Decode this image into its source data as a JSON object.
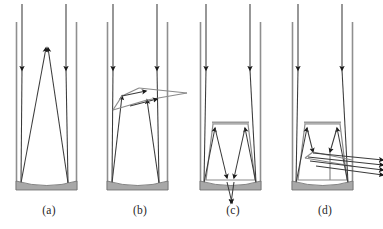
{
  "figure": {
    "width": 383,
    "height": 229,
    "background_color": "#ffffff",
    "colors": {
      "ray_stroke": "#3a3a3a",
      "arrowhead_fill": "#1a1a1a",
      "tube_wall": "#8f8f8f",
      "mirror_fill": "#a8a8a8",
      "mirror_stroke": "#6d6d6d",
      "insert_stroke": "#8a8a8a",
      "label_color": "#1f1f1f"
    },
    "panels": [
      {
        "id": "a",
        "label": "(a)",
        "label_x": 49,
        "label_y": 214,
        "description": "Two vertical rays enter the tube, strike the concave bottom mirror and reflect upward converging to an apex near the top of the tube.",
        "incoming_ray_count": 2,
        "reflected_ray_count": 2,
        "escaping_ray_count": 0,
        "has_insert": false,
        "insert_shape": "none",
        "tube": {
          "left_x": 16,
          "right_x": 77,
          "top_y": 22,
          "bottom_y": 190
        },
        "outer_rays": [
          {
            "x": 22,
            "y_start": 4,
            "y_end": 72
          },
          {
            "x": 66,
            "y_start": 4,
            "y_end": 72
          }
        ],
        "mirror": {
          "x1": 16,
          "x2": 77,
          "top_y": 182,
          "bottom_y": 191,
          "sag": 5
        },
        "bounce_rays": [
          {
            "x1": 22,
            "y1": 72,
            "x2": 21,
            "y2": 184,
            "x3": 47,
            "y3": 48
          },
          {
            "x1": 66,
            "y1": 72,
            "x2": 68,
            "y2": 184,
            "x3": 47,
            "y3": 48
          }
        ]
      },
      {
        "id": "b",
        "label": "(b)",
        "label_x": 140,
        "label_y": 214,
        "description": "Rays reflect off the concave bottom, travel up to a small tilted facet near mid-tube, and are deflected sideways escaping to the right of the tube.",
        "incoming_ray_count": 2,
        "reflected_ray_count": 2,
        "escaping_ray_count": 2,
        "has_insert": true,
        "insert_shape": "tilted-facet",
        "tube": {
          "left_x": 107,
          "right_x": 168,
          "top_y": 22,
          "bottom_y": 190
        },
        "outer_rays": [
          {
            "x": 113,
            "y_start": 4,
            "y_end": 72
          },
          {
            "x": 157,
            "y_start": 4,
            "y_end": 72
          }
        ],
        "mirror": {
          "x1": 107,
          "x2": 168,
          "top_y": 182,
          "bottom_y": 191,
          "sag": 5
        },
        "escape_target_x": 192
      },
      {
        "id": "c",
        "label": "(c)",
        "label_x": 233,
        "label_y": 214,
        "description": "A trapezoidal insert sits inside the tube; rays bounce off the bottom mirror, up the trapezoid sides and back down through a gap in the bottom of the tube.",
        "incoming_ray_count": 2,
        "reflected_ray_count": 2,
        "escaping_ray_count": 2,
        "has_insert": true,
        "insert_shape": "trapezoid",
        "tube": {
          "left_x": 200,
          "right_x": 261,
          "top_y": 22,
          "bottom_y": 190
        },
        "outer_rays": [
          {
            "x": 206,
            "y_start": 4,
            "y_end": 72
          },
          {
            "x": 250,
            "y_start": 4,
            "y_end": 72
          }
        ],
        "mirror": {
          "x1": 200,
          "x2": 261,
          "top_y": 182,
          "bottom_y": 191,
          "sag": 5
        },
        "insert": {
          "top_left_x": 213,
          "top_right_x": 248,
          "top_y": 122,
          "bottom_left_x": 206,
          "bottom_right_x": 255,
          "bottom_y": 180
        },
        "escape_direction": "downward-through-bottom"
      },
      {
        "id": "d",
        "label": "(d)",
        "label_x": 325,
        "label_y": 214,
        "description": "Same trapezoidal insert as (c), but the downward rays are redirected sideways and exit as a bundle of parallel rays through the right wall of the tube.",
        "incoming_ray_count": 2,
        "reflected_ray_count": 2,
        "escaping_ray_count": 4,
        "has_insert": true,
        "insert_shape": "trapezoid",
        "tube": {
          "left_x": 292,
          "right_x": 353,
          "top_y": 22,
          "bottom_y": 190
        },
        "outer_rays": [
          {
            "x": 298,
            "y_start": 4,
            "y_end": 72
          },
          {
            "x": 342,
            "y_start": 4,
            "y_end": 72
          }
        ],
        "mirror": {
          "x1": 292,
          "x2": 353,
          "top_y": 182,
          "bottom_y": 191,
          "sag": 5
        },
        "insert": {
          "top_left_x": 305,
          "top_right_x": 340,
          "top_y": 122,
          "bottom_left_x": 298,
          "bottom_right_x": 347,
          "bottom_y": 180
        },
        "escape_direction": "rightward-bundle",
        "escape_target_x": 383
      }
    ]
  }
}
